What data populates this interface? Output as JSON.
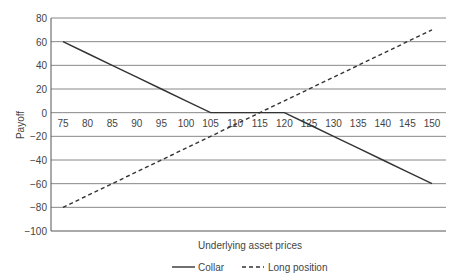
{
  "chart_data": {
    "type": "line",
    "title": "",
    "xlabel": "Underlying asset prices",
    "ylabel": "Payoff",
    "x": [
      75,
      80,
      85,
      90,
      95,
      100,
      105,
      110,
      115,
      120,
      125,
      130,
      135,
      140,
      145,
      150
    ],
    "x_tick_labels": [
      "75",
      "80",
      "85",
      "90",
      "95",
      "100",
      "105",
      "110",
      "115",
      "120",
      "125",
      "130",
      "135",
      "140",
      "145",
      "150"
    ],
    "y_ticks": [
      80,
      60,
      40,
      20,
      0,
      -20,
      -40,
      -60,
      -80,
      -100
    ],
    "ylim": [
      -100,
      80
    ],
    "xlim": [
      75,
      150
    ],
    "grid": "horizontal",
    "legend_position": "bottom",
    "series": [
      {
        "name": "Collar",
        "style": "solid",
        "values": [
          60,
          50,
          40,
          30,
          20,
          10,
          0,
          0,
          0,
          0,
          -10,
          -20,
          -30,
          -40,
          -50,
          -60
        ]
      },
      {
        "name": "Long position",
        "style": "dashed",
        "values": [
          -80,
          -70,
          -60,
          -50,
          -40,
          -30,
          -20,
          -10,
          0,
          10,
          20,
          30,
          40,
          50,
          60,
          70
        ]
      }
    ]
  },
  "legend": {
    "collar": "Collar",
    "long": "Long position"
  }
}
